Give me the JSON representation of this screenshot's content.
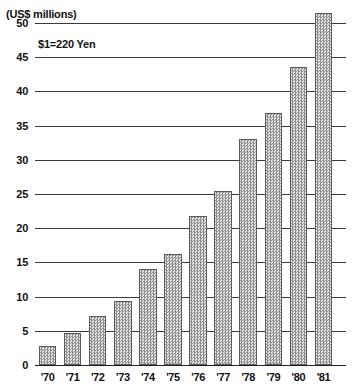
{
  "chart_data": {
    "type": "bar",
    "title": "",
    "subtitle": "",
    "xlabel": "",
    "ylabel": "(US$ millions)",
    "ylim": [
      0,
      52.5
    ],
    "yticks": [
      0,
      5,
      10,
      15,
      20,
      25,
      30,
      35,
      40,
      45,
      50
    ],
    "ytick_labels": [
      "0",
      "5",
      "10",
      "15",
      "20",
      "25",
      "30",
      "35",
      "40",
      "45",
      "50"
    ],
    "grid": true,
    "legend": null,
    "legend_position": "none",
    "annotations": [
      {
        "text": "$1=220 Yen",
        "x": "'71",
        "y": 47.5
      }
    ],
    "categories": [
      "'70",
      "'71",
      "'72",
      "'73",
      "'74",
      "'75",
      "'76",
      "'77",
      "'78",
      "'79",
      "'80",
      "'81"
    ],
    "values": [
      2.8,
      4.7,
      7.2,
      9.4,
      14.0,
      16.2,
      21.8,
      25.5,
      33.0,
      36.8,
      43.5,
      51.5
    ]
  },
  "axis": {
    "unit_label": "(US$ millions)"
  },
  "note": {
    "text": "$1=220 Yen"
  },
  "colors": {
    "bar_fill_light": "#e4e4e4",
    "bar_fill_dark": "#8f8f8f",
    "bar_border": "#5b5b5b",
    "gridline": "#3a3a3a",
    "axis": "#222222",
    "text": "#111111",
    "background": "#ffffff"
  }
}
